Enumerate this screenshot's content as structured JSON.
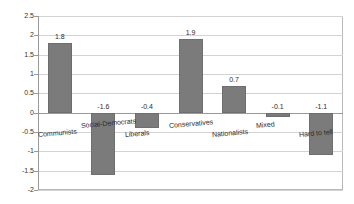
{
  "chart_data": {
    "type": "bar",
    "title": "",
    "subtitle": "",
    "xlabel": "",
    "ylabel": "",
    "categories": [
      "Communists",
      "Social-Democrats",
      "Liberals",
      "Conservatives",
      "Nationalists",
      "Mixed",
      "Hard to tell"
    ],
    "values": [
      1.8,
      -1.6,
      -0.4,
      1.9,
      0.7,
      -0.1,
      -1.1
    ],
    "data_labels": [
      "1.8",
      "-1.6",
      "-0.4",
      "1.9",
      "0.7",
      "-0.1",
      "-1.1"
    ],
    "ylim": [
      -2,
      2.5
    ],
    "ytick_labels": [
      "2.5",
      "2",
      "1.5",
      "1",
      "0.5",
      "0",
      "-0.5",
      "-1",
      "-1.5",
      "-2"
    ],
    "ytick_values": [
      2.5,
      2,
      1.5,
      1,
      0.5,
      0,
      -0.5,
      -1,
      -1.5,
      -2
    ],
    "grid": true,
    "grid_axis": "y",
    "legend": false,
    "legend_position": "none",
    "bar_color": "#7b7b7b",
    "grid_color": "#d3d3d3",
    "axis_color": "#9a9a9a",
    "background": "#ffffff"
  }
}
